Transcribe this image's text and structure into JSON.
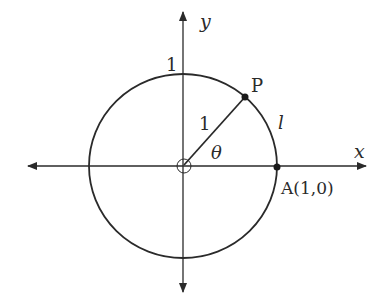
{
  "diagram": {
    "type": "unit-circle",
    "stroke_color": "#2a2a2a",
    "background": "#ffffff",
    "labels": {
      "x_axis": "x",
      "y_axis": "y",
      "top_intercept": "1",
      "point_p": "P",
      "radius": "1",
      "angle": "θ",
      "arc": "l",
      "point_a": "A(1,0)"
    },
    "points": [
      {
        "name": "P",
        "description": "point on circle at angle θ"
      },
      {
        "name": "A",
        "coords": "(1,0)"
      },
      {
        "name": "O",
        "description": "origin (open circle)"
      }
    ]
  }
}
